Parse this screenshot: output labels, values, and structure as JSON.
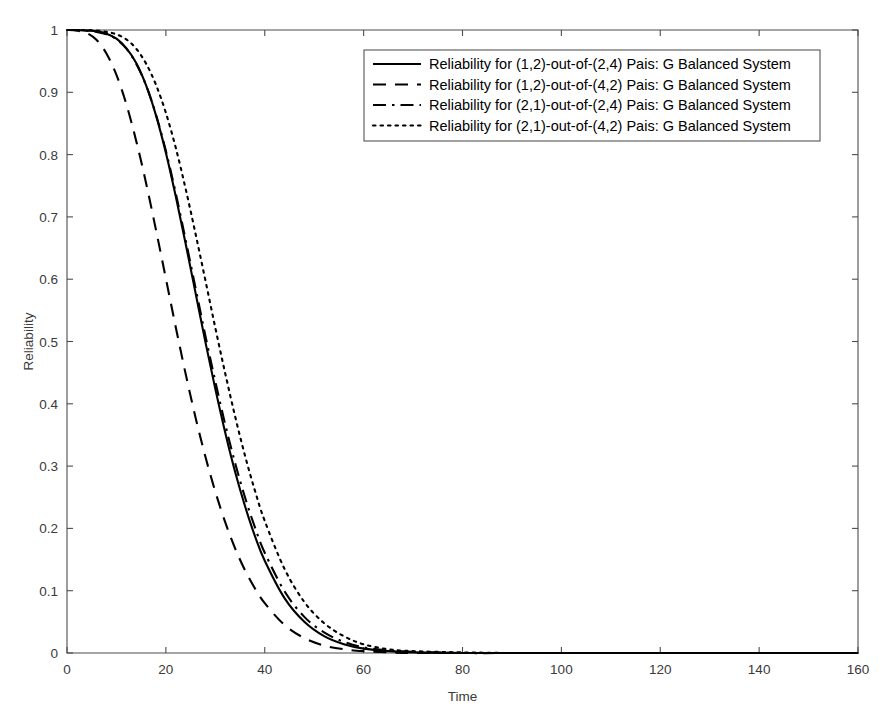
{
  "chart_data": {
    "type": "line",
    "title": "",
    "xlabel": "Time",
    "ylabel": "Reliability",
    "xlim": [
      0,
      160
    ],
    "ylim": [
      0,
      1
    ],
    "xticks": [
      0,
      20,
      40,
      60,
      80,
      100,
      120,
      140,
      160
    ],
    "xtick_labels": [
      "0",
      "20",
      "40",
      "60",
      "80",
      "100",
      "120",
      "140",
      "160"
    ],
    "yticks": [
      0,
      0.1,
      0.2,
      0.3,
      0.4,
      0.5,
      0.6,
      0.7,
      0.8,
      0.9,
      1
    ],
    "ytick_labels": [
      "0",
      "0.1",
      "0.2",
      "0.3",
      "0.4",
      "0.5",
      "0.6",
      "0.7",
      "0.8",
      "0.9",
      "1"
    ],
    "grid": false,
    "legend_position": "top-center",
    "x": [
      0,
      2,
      4,
      6,
      8,
      10,
      12,
      14,
      16,
      18,
      20,
      22,
      24,
      26,
      28,
      30,
      32,
      34,
      36,
      38,
      40,
      44,
      48,
      52,
      56,
      60,
      65,
      70,
      80,
      90,
      100,
      120,
      140,
      160
    ],
    "series": [
      {
        "name": "Reliability for (1,2)-out-of-(2,4) Pais: G Balanced System",
        "linestyle": "solid",
        "color": "#000000",
        "values": [
          1.0,
          1.0,
          0.999,
          0.998,
          0.994,
          0.986,
          0.971,
          0.947,
          0.911,
          0.863,
          0.803,
          0.733,
          0.657,
          0.578,
          0.499,
          0.424,
          0.354,
          0.291,
          0.236,
          0.188,
          0.148,
          0.088,
          0.05,
          0.027,
          0.014,
          0.007,
          0.003,
          0.001,
          0.0,
          0.0,
          0.0,
          0.0,
          0.0,
          0.0
        ]
      },
      {
        "name": "Reliability for (1,2)-out-of-(4,2) Pais: G Balanced System",
        "linestyle": "dashed",
        "color": "#000000",
        "values": [
          1.0,
          0.999,
          0.995,
          0.984,
          0.962,
          0.928,
          0.881,
          0.822,
          0.754,
          0.679,
          0.601,
          0.523,
          0.448,
          0.378,
          0.315,
          0.259,
          0.21,
          0.168,
          0.133,
          0.104,
          0.08,
          0.045,
          0.024,
          0.012,
          0.006,
          0.003,
          0.001,
          0.0,
          0.0,
          0.0,
          0.0,
          0.0,
          0.0,
          0.0
        ]
      },
      {
        "name": "Reliability for (2,1)-out-of-(2,4) Pais: G Balanced System",
        "linestyle": "dashdot",
        "color": "#000000",
        "values": [
          1.0,
          1.0,
          0.999,
          0.997,
          0.993,
          0.985,
          0.97,
          0.946,
          0.911,
          0.864,
          0.806,
          0.738,
          0.663,
          0.586,
          0.509,
          0.436,
          0.367,
          0.305,
          0.25,
          0.202,
          0.161,
          0.099,
          0.058,
          0.033,
          0.018,
          0.009,
          0.004,
          0.002,
          0.0,
          0.0,
          0.0,
          0.0,
          0.0,
          0.0
        ]
      },
      {
        "name": "Reliability for (2,1)-out-of-(4,2) Pais: G Balanced System",
        "linestyle": "dotted",
        "color": "#000000",
        "values": [
          1.0,
          1.0,
          1.0,
          0.999,
          0.997,
          0.993,
          0.985,
          0.97,
          0.946,
          0.912,
          0.867,
          0.811,
          0.745,
          0.673,
          0.598,
          0.522,
          0.449,
          0.38,
          0.317,
          0.261,
          0.212,
          0.135,
          0.082,
          0.048,
          0.027,
          0.014,
          0.006,
          0.003,
          0.001,
          0.0,
          0.0,
          0.0,
          0.0,
          0.0
        ]
      }
    ],
    "legend_entries": [
      {
        "label": "Reliability for (1,2)-out-of-(2,4) Pais: G Balanced System",
        "linestyle": "solid"
      },
      {
        "label": "Reliability for (1,2)-out-of-(4,2) Pais: G Balanced System",
        "linestyle": "dashed"
      },
      {
        "label": "Reliability for (2,1)-out-of-(2,4) Pais: G Balanced System",
        "linestyle": "dashdot"
      },
      {
        "label": "Reliability for (2,1)-out-of-(4,2) Pais: G Balanced System",
        "linestyle": "dotted"
      }
    ]
  }
}
